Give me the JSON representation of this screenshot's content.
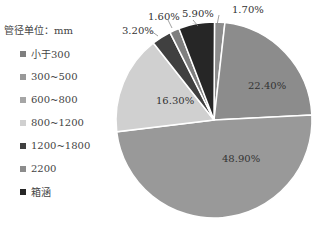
{
  "chart_data": {
    "type": "pie",
    "title": "",
    "legend_title": "管径单位：mm",
    "legend_position": "left",
    "categories": [
      "小于300",
      "300~500",
      "600~800",
      "800~1200",
      "1200~1800",
      "2200",
      "箱涵"
    ],
    "colors": [
      "#7f7f7f",
      "#999999",
      "#a6a6a6",
      "#d0d0d0",
      "#404040",
      "#8c8c8c",
      "#262626"
    ],
    "slices_clockwise_from_top": [
      {
        "label": "1.70%",
        "value": 1.7,
        "color": "#8c8c8c"
      },
      {
        "label": "22.40%",
        "value": 22.4,
        "color": "#8c8c8c"
      },
      {
        "label": "48.90%",
        "value": 48.9,
        "color": "#999999"
      },
      {
        "label": "16.30%",
        "value": 16.3,
        "color": "#d0d0d0"
      },
      {
        "label": "3.20%",
        "value": 3.2,
        "color": "#404040"
      },
      {
        "label": "1.60%",
        "value": 1.6,
        "color": "#7f7f7f"
      },
      {
        "label": "5.90%",
        "value": 5.9,
        "color": "#262626"
      }
    ]
  },
  "legend": {
    "title": "管径单位：mm",
    "items": [
      {
        "label": "小于300",
        "color": "#7f7f7f"
      },
      {
        "label": "300~500",
        "color": "#999999"
      },
      {
        "label": "600~800",
        "color": "#a6a6a6"
      },
      {
        "label": "800~1200",
        "color": "#d0d0d0"
      },
      {
        "label": "1200~1800",
        "color": "#404040"
      },
      {
        "label": "2200",
        "color": "#8c8c8c"
      },
      {
        "label": "箱涵",
        "color": "#262626"
      }
    ]
  }
}
